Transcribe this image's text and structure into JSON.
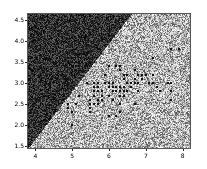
{
  "figure": {
    "width": 207,
    "height": 169,
    "background": "#ffffff",
    "title": ""
  },
  "chart_data": {
    "type": "scatter",
    "title": "",
    "subtitle": "",
    "xlabel": "",
    "ylabel": "",
    "xlim": [
      3.8,
      8.2
    ],
    "ylim": [
      1.45,
      4.65
    ],
    "grid": false,
    "legend": null,
    "xticks": [
      4,
      5,
      6,
      7,
      8
    ],
    "xtick_labels": [
      "4",
      "5",
      "6",
      "7",
      "8"
    ],
    "yticks": [
      1.5,
      2.0,
      2.5,
      3.0,
      3.5,
      4.0,
      4.5
    ],
    "ytick_labels": [
      "1.5",
      "2.0",
      "2.5",
      "3.0",
      "3.5",
      "4.0",
      "4.5"
    ],
    "regions": [
      {
        "name": "class-region-upper-left",
        "fill": "#2b2b2b",
        "noise_light": "#5a5a5a",
        "noise_dark": "#0d0d0d"
      },
      {
        "name": "class-region-lower-right",
        "fill": "#b9b9b9",
        "noise_light": "#e8e8e8",
        "noise_dark": "#6e6e6e"
      }
    ],
    "boundary": {
      "name": "decision-boundary",
      "description": "diagonal boundary rising left-to-right",
      "x_at_ymin": 3.8,
      "y_at_xmin": 2.42,
      "x_at_ymax": 6.6,
      "slope": 0.78
    },
    "series": [
      {
        "name": "data-points",
        "marker": "square",
        "color": "#111111",
        "size": 2.2,
        "x": [
          5.1,
          4.9,
          4.7,
          4.6,
          5.0,
          5.4,
          4.6,
          5.0,
          4.4,
          4.9,
          5.4,
          4.8,
          4.8,
          4.3,
          5.8,
          5.7,
          5.4,
          5.1,
          5.7,
          5.1,
          5.4,
          5.1,
          4.6,
          5.1,
          4.8,
          5.0,
          5.0,
          5.2,
          5.2,
          4.7,
          4.8,
          5.4,
          5.2,
          5.5,
          4.9,
          5.0,
          5.5,
          4.9,
          4.4,
          5.1,
          5.0,
          4.5,
          4.4,
          5.0,
          5.1,
          4.8,
          5.1,
          4.6,
          5.3,
          5.0,
          7.0,
          6.4,
          6.9,
          5.5,
          6.5,
          5.7,
          6.3,
          4.9,
          6.6,
          5.2,
          5.0,
          5.9,
          6.0,
          6.1,
          5.6,
          6.7,
          5.6,
          5.8,
          6.2,
          5.6,
          5.9,
          6.1,
          6.3,
          6.1,
          6.4,
          6.6,
          6.8,
          6.7,
          6.0,
          5.7,
          5.5,
          5.5,
          5.8,
          6.0,
          5.4,
          6.0,
          6.7,
          6.3,
          5.6,
          5.5,
          5.5,
          6.1,
          5.8,
          5.0,
          5.6,
          5.7,
          5.7,
          6.2,
          5.1,
          5.7,
          6.3,
          5.8,
          7.1,
          6.3,
          6.5,
          7.6,
          4.9,
          7.3,
          6.7,
          7.2,
          6.5,
          6.4,
          6.8,
          5.7,
          5.8,
          6.4,
          6.5,
          7.7,
          7.7,
          6.0,
          6.9,
          5.6,
          7.7,
          6.3,
          6.7,
          7.2,
          6.2,
          6.1,
          6.4,
          7.2,
          7.4,
          7.9,
          6.4,
          6.3,
          6.1,
          7.7,
          6.3,
          6.4,
          6.0,
          6.9,
          6.7,
          6.9,
          5.8,
          6.8,
          6.7,
          6.7,
          6.3,
          6.5,
          6.2,
          5.9
        ],
        "y": [
          3.5,
          3.0,
          3.2,
          3.1,
          3.6,
          3.9,
          3.4,
          3.4,
          2.9,
          3.1,
          3.7,
          3.4,
          3.0,
          3.0,
          4.0,
          4.4,
          3.9,
          3.5,
          3.8,
          3.8,
          3.4,
          3.7,
          3.6,
          3.3,
          3.4,
          3.0,
          3.4,
          3.5,
          3.4,
          3.2,
          3.1,
          3.4,
          4.1,
          4.2,
          3.1,
          3.2,
          3.5,
          3.6,
          3.0,
          3.4,
          3.5,
          2.3,
          3.2,
          3.5,
          3.8,
          3.0,
          3.8,
          3.2,
          3.7,
          3.3,
          3.2,
          3.2,
          3.1,
          2.3,
          2.8,
          2.8,
          3.3,
          2.4,
          2.9,
          2.7,
          2.0,
          3.0,
          2.2,
          2.9,
          2.9,
          3.1,
          3.0,
          2.7,
          2.2,
          2.5,
          3.2,
          2.8,
          2.5,
          2.8,
          2.9,
          3.0,
          2.8,
          3.0,
          2.9,
          2.6,
          2.4,
          2.4,
          2.7,
          2.7,
          3.0,
          3.4,
          3.1,
          2.3,
          3.0,
          2.5,
          2.6,
          3.0,
          2.6,
          2.3,
          2.7,
          3.0,
          2.9,
          2.9,
          2.5,
          2.8,
          3.3,
          2.7,
          3.0,
          2.9,
          3.0,
          3.0,
          2.5,
          2.9,
          2.5,
          3.6,
          3.2,
          2.7,
          3.0,
          2.5,
          2.8,
          3.2,
          3.0,
          3.8,
          2.6,
          2.2,
          3.2,
          2.8,
          2.8,
          2.7,
          3.3,
          3.2,
          2.8,
          3.0,
          2.8,
          3.0,
          2.8,
          3.8,
          2.8,
          2.8,
          2.6,
          3.0,
          3.4,
          3.1,
          3.0,
          3.1,
          3.1,
          3.1,
          2.7,
          3.2,
          3.3,
          3.0,
          2.5,
          3.0,
          3.4,
          3.0
        ]
      }
    ]
  },
  "axes": {
    "x_ticks": [
      "4",
      "5",
      "6",
      "7",
      "8"
    ],
    "y_ticks": [
      "4.5",
      "4.0",
      "3.5",
      "3.0",
      "2.5",
      "2.0",
      "1.5"
    ]
  }
}
